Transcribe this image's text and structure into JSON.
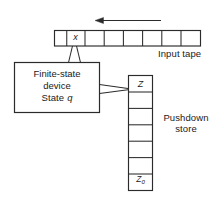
{
  "figure": {
    "width": 220,
    "height": 205,
    "background": "#ffffff",
    "stroke_color": "#2b2b2b",
    "text_color": "#1a1a1a"
  },
  "input_tape": {
    "label": "Input tape",
    "cell_count": 8,
    "cells": [
      {
        "index": 0,
        "value": ""
      },
      {
        "index": 1,
        "value": "x"
      },
      {
        "index": 2,
        "value": ""
      },
      {
        "index": 3,
        "value": ""
      },
      {
        "index": 4,
        "value": ""
      },
      {
        "index": 5,
        "value": ""
      },
      {
        "index": 6,
        "value": ""
      },
      {
        "index": 7,
        "value": ""
      }
    ],
    "current_symbol": "x",
    "head_cell_index": 1,
    "direction_arrow": {
      "name": "tape-motion-arrow",
      "points": "left"
    }
  },
  "finite_state_device": {
    "line1": "Finite-state",
    "line2": "device",
    "line3_prefix": "State",
    "state_symbol": "q"
  },
  "pushdown_store": {
    "label_line1": "Pushdown",
    "label_line2": "store",
    "cell_count": 7,
    "cells": [
      {
        "index": 0,
        "value": "Z",
        "position": "top"
      },
      {
        "index": 1,
        "value": ""
      },
      {
        "index": 2,
        "value": ""
      },
      {
        "index": 3,
        "value": ""
      },
      {
        "index": 4,
        "value": ""
      },
      {
        "index": 5,
        "value": ""
      },
      {
        "index": 6,
        "value": "Z0",
        "position": "bottom"
      }
    ],
    "top_symbol": "Z",
    "bottom_symbol_base": "Z",
    "bottom_symbol_subscript": "0"
  },
  "connectors": {
    "read_head": "read-head-wedge",
    "stack_link": "stack-link-wedge"
  }
}
